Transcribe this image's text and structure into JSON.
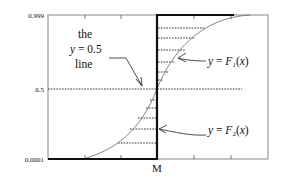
{
  "diagram": {
    "y_ticks": [
      {
        "label": "0.999",
        "y": 15
      },
      {
        "label": "0.5",
        "y": 89
      },
      {
        "label": "0.0001",
        "y": 159
      }
    ],
    "x_marker": {
      "label": "M"
    },
    "annotations": {
      "half_line": {
        "line1": "the",
        "line2_var": "y",
        "line2_rest": " = 0.5",
        "line3": "line"
      },
      "f1": {
        "var": "y",
        "eq": " = ",
        "fn": "F",
        "sub": "1",
        "arg_open": "(",
        "arg": "x",
        "arg_close": ")"
      },
      "f2": {
        "var": "y",
        "eq": " = ",
        "fn": "F",
        "sub": "2",
        "arg_open": "(",
        "arg": "x",
        "arg_close": ")"
      }
    },
    "colors": {
      "axis": "#222222",
      "step": "#111111",
      "curve": "#666666",
      "dash": "#333333"
    }
  }
}
